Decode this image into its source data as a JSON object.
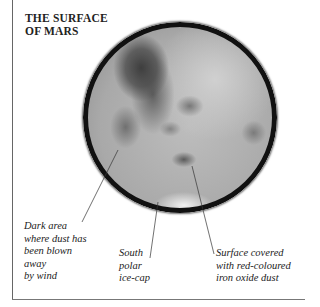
{
  "title": {
    "lines": [
      "THE SURFACE",
      "OF MARS"
    ]
  },
  "diagram": {
    "colors": {
      "rim": "#111111",
      "surface_light": "#d0d0d0",
      "surface_dark": "#3e3e3e",
      "frame": "#666666"
    }
  },
  "labels": [
    {
      "id": "dark-area",
      "lines": [
        "Dark area",
        "where dust has",
        "been blown",
        "away",
        "by wind"
      ]
    },
    {
      "id": "south-polar-ice-cap",
      "lines": [
        "South",
        "polar",
        "ice-cap"
      ]
    },
    {
      "id": "surface-dust",
      "lines": [
        "Surface covered",
        "with red-coloured",
        "iron oxide dust"
      ]
    }
  ]
}
